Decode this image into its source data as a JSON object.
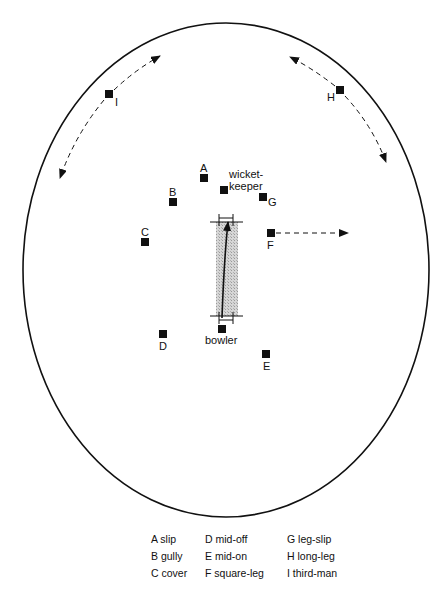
{
  "diagram": {
    "fielders": [
      {
        "code": "A",
        "x": 204,
        "y": 178
      },
      {
        "code": "B",
        "x": 173,
        "y": 202
      },
      {
        "code": "C",
        "x": 145,
        "y": 242
      },
      {
        "code": "D",
        "x": 163,
        "y": 334
      },
      {
        "code": "E",
        "x": 266,
        "y": 354
      },
      {
        "code": "F",
        "x": 271,
        "y": 233
      },
      {
        "code": "G",
        "x": 263,
        "y": 197
      },
      {
        "code": "H",
        "x": 340,
        "y": 90
      },
      {
        "code": "I",
        "x": 109,
        "y": 94
      }
    ],
    "wicketkeeper_label_1": "wicket-",
    "wicketkeeper_label_2": "keeper",
    "bowler_label": "bowler",
    "labels": {
      "A": "A",
      "B": "B",
      "C": "C",
      "D": "D",
      "E": "E",
      "F": "F",
      "G": "G",
      "H": "H",
      "I": "I"
    }
  },
  "legend": [
    {
      "code": "A",
      "name": "slip"
    },
    {
      "code": "D",
      "name": "mid-off"
    },
    {
      "code": "G",
      "name": "leg-slip"
    },
    {
      "code": "B",
      "name": "gully"
    },
    {
      "code": "E",
      "name": "mid-on"
    },
    {
      "code": "H",
      "name": "long-leg"
    },
    {
      "code": "C",
      "name": "cover"
    },
    {
      "code": "F",
      "name": "square-leg"
    },
    {
      "code": "I",
      "name": "third-man"
    }
  ],
  "legend_text": [
    "A slip",
    "D mid-off",
    "G leg-slip",
    "B gully",
    "E mid-on",
    "H long-leg",
    "C cover",
    "F square-leg",
    "I third-man"
  ]
}
